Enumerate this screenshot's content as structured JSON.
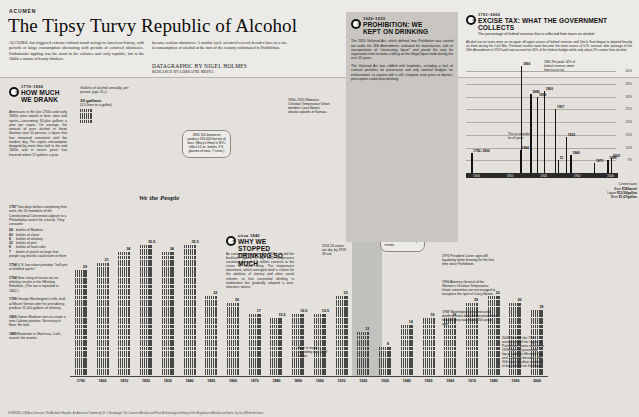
{
  "masthead": {
    "kicker": "ACUMEN",
    "headline": "The Tipsy Turvy Republic of Alcohol",
    "dek_left": "ALCOHOL has triggered extreme cultural mood swings in American history, with periods of binge consumption alternating with periods of enforced abstinence. Enthusiastic tippling was the norm in the colonies and early republic, but in the 1840s a nation of hearty drinkers",
    "dek_right": "became zealous abstainers. A similar cycle occurred several decades later as a rise in consumption of alcohol at the turn of the century culminated in Prohibition.",
    "byline": "DATAGRAPHIC BY NIGEL HOLMES",
    "byline_sub": "RESEARCH BY LORRAINE MOFFA"
  },
  "panel_howmuch": {
    "years": "1770–1990",
    "title_line1": "HOW MUCH",
    "title_line2": "WE DRANK",
    "axis_note": "Gallons of alcohol annually, per person (age 15+)",
    "key_value": "32 gallons",
    "key_sub": "(5.5 litres to a gallon)",
    "body": [
      "Americans in the late 1700s and early 1800s were awash in beer, wine and spirits—consuming 30-plus gallons a year per capita. On average, the amount of pure alcohol in those libations was 10 percent, a figure that has remained consistent until the modern day. Per capita consumption dropped by more than half in the mid 1800s and in recent years has hovered where 22 gallons a year."
    ]
  },
  "timeline": [
    {
      "year": "1787",
      "text": "Two days before completing their work, the 55 members of the Constitutional Convention adjourn to a Philadelphia tavern for a break. They consume:"
    },
    {
      "year": "1794",
      "text": "New ruling of excise tax on whiskey results in the Whiskey Rebellion. (The tax is repealed in 1802.)"
    },
    {
      "year": "1799",
      "text": "George Washington's stills, built at Mount Vernon after his presidency, produce 11,000 gallons of whiskey."
    },
    {
      "year": "1809",
      "text": "James Madison tries to create a new Cabinet position: Secretary of Beer. He fails."
    },
    {
      "year": "1849",
      "text": "Bartender in Wachusa, Calif., invents the martini."
    },
    {
      "year": "1794",
      "text": "U.S. law ration provides \"half pint of distilled spirits.\""
    }
  ],
  "convention_drinks": {
    "header": "",
    "items": [
      {
        "qty": "54",
        "item": "bottles of Madeira"
      },
      {
        "qty": "60",
        "item": "bottles of claret"
      },
      {
        "qty": "8",
        "item": "bottles of whiskey"
      },
      {
        "qty": "22",
        "item": "bottles of port"
      },
      {
        "qty": "8",
        "item": "bottles of hard cider"
      },
      {
        "qty": "7",
        "item": "bowls of punch so large that people say drunks could swim in them"
      }
    ]
  },
  "panel_why": {
    "years": "circa 1840",
    "title_line1": "WHY WE STOPPED",
    "title_line2": "DRINKING SO MUCH",
    "body": "As consumption rose in the 1820s, so did the backlash against it. By 1835 temperance societies claimed 1.5 million converts to the cause of moral living. The temperance movement, which emerged amid a clamor for the abolition of slavery and other social reforms, at first counseled drinking in moderation but gradually adopted a zero-tolerance stance."
  },
  "panel_prohibition": {
    "years": "1920–1933",
    "title_line1": "PROHIBITION: WE",
    "title_line2": "KEPT ON DRINKING",
    "body": [
      "The 1920 Volstead Act, which defined how Prohibition was carried out under the 18th Amendment, outlawed the manufacture, sale or transportation of \"intoxicating liquor\" and paved the way for organized crime to make a killing on the illegal liquor trade during the next 13 years.",
      "The Volstead Act was riddled with loopholes, including a lack of criminal penalties for possession and only nominal budgets for enforcement, so anyone with a still, vineyard, wine press or doctor's prescription could keep drinking."
    ]
  },
  "panel_excise": {
    "years": "1791–2000",
    "title": "EXCISE TAX: WHAT THE GOVERNMENT COLLECTS",
    "subtitle": "The percentage of federal revenue that is collected from taxes on alcohol",
    "body": "Alcohol excise taxes were an on-again off-again source of federal revenue until Uncle Sam began to depend heavily on them during the Civil War. Personal income taxes became the main source of U.S. revenue after passage of the 16th Amendment in 1913 and now account for 45% of the federal budget while only about 2% comes from alcohol.",
    "current_tax_header": "Current taxes",
    "current_tax": [
      {
        "label": "Beer",
        "value": "$18/barrel"
      },
      {
        "label": "Liquor",
        "value": "$13.50/gallon"
      },
      {
        "label": "Wine",
        "value": "$1.07/gallon"
      }
    ]
  },
  "annotations": {
    "a1830": "1830\n150 breweries produce 185,000 barrels of beer. (Macy's Hotel in NYC offers 12 oz. bottles, 3 ¢; glasses of wine, 7 cents.)",
    "a1787_chart": "1787",
    "a1820": "1820",
    "a1874": "1874",
    "a1900_1920": "1900–1920\nWoman's Christian Temperance Union member Carry Nation attacks saloons in Kansas.",
    "a1916": "1916\n24 states are dry; by 1919, 33 are.",
    "a1933": "1933 FDR toasts the end of Prohibition with a dry martini.",
    "a1976": "1976 President Carter signs bill legalizing home brewing for the first time since Prohibition.",
    "a1984": "1984 Attorney General of the Woman's Christian Temperance Union convention are encouraged to recognize the spirit of Carry Nation.",
    "a1988": "1988 Washington's reconstructed distillery hosts daily demonstrations of how whiskey was made 200 years ago.",
    "a2008": "2008 To mark the 75th anniversary of the repeal of Prohibition, states overturn a 1933 law that prevented liquor sales on Election Day and Colorado becomes the 35th state to allow residents to buy alcohol on Sundays.",
    "a1979": "Beer is made according to a 1979 recipe.",
    "excise_peak": "1864\nThe peak: 42% of federal revenue comes from excise tax",
    "excise_1790s": "1790–1802",
    "excise_nota": "This act provides for all years",
    "we_the_people": "We the People"
  },
  "chart_data": {
    "type": "bar",
    "title": "Gallons of alcohol annually, per person (age 15+)",
    "ylabel": "Gallons of alcohol",
    "xlabel": "Year",
    "ylim": [
      0,
      36
    ],
    "categories": [
      "1790",
      "1800",
      "1810",
      "1820",
      "1830",
      "1840",
      "1850",
      "1860",
      "1870",
      "1880",
      "1890",
      "1900",
      "1910",
      "1920",
      "1930",
      "1940",
      "1950",
      "1960",
      "1970",
      "1980",
      "1990",
      "2000"
    ],
    "values": [
      29,
      31,
      34,
      35.5,
      34,
      35.5,
      22,
      20,
      17,
      15.5,
      16.5,
      16.5,
      22,
      12,
      8,
      14,
      16,
      16,
      20,
      22,
      20,
      18
    ],
    "value_labels": [
      "29",
      "31",
      "34",
      "35.5",
      "34",
      "35.5",
      "22",
      "20",
      "17",
      "15.5",
      "16.5",
      "16.5",
      "22",
      "12",
      "8",
      "14",
      "16",
      "16",
      "20",
      "22",
      "20",
      "18"
    ],
    "unit": "gallons",
    "glyph": "glass-pictogram",
    "shaded_region": {
      "label": "Prohibition",
      "from": "1920",
      "to": "1933"
    },
    "grid": false,
    "legend": "none"
  },
  "excise_chart": {
    "type": "bar",
    "title": "The percentage of federal revenue that is collected from taxes on alcohol",
    "ylabel": "% of federal revenue",
    "ylim": [
      0,
      42
    ],
    "yticks": [
      "40%",
      "35%",
      "30%",
      "25%",
      "20%",
      "15%",
      "10%",
      "5%"
    ],
    "xticks": [
      "1800",
      "1850",
      "1900",
      "1950",
      "2000"
    ],
    "points": [
      {
        "year": "1792",
        "label": "1792–1802",
        "value": 8
      },
      {
        "year": "1864",
        "label": "1864",
        "value": 9
      },
      {
        "year": "1866",
        "label": "1866",
        "value": 42
      },
      {
        "year": "1880",
        "label": "1880",
        "value": 31
      },
      {
        "year": "1890",
        "label": "1890",
        "value": 30
      },
      {
        "year": "1900",
        "label": "1900",
        "value": 32
      },
      {
        "year": "1917",
        "label": "1917",
        "value": 25
      },
      {
        "year": "1921",
        "label": "21",
        "value": 5
      },
      {
        "year": "1933",
        "label": "1933",
        "value": 14
      },
      {
        "year": "1940",
        "label": "1940",
        "value": 7
      },
      {
        "year": "1975",
        "label": "1975",
        "value": 4
      },
      {
        "year": "1995",
        "label": "1995",
        "value": 5
      },
      {
        "year": "2000",
        "label": "2000",
        "value": 6
      }
    ]
  },
  "credit": "SOURCES: USDA as Deneuve; The Alcoholic Republic: An American Tradition by W. J. Rorabaugh; The Control of Alcohol and Plural: A Genealogical History of the Regulation of Alcohol and Spirits, by Jan-Willem Gerritsen."
}
